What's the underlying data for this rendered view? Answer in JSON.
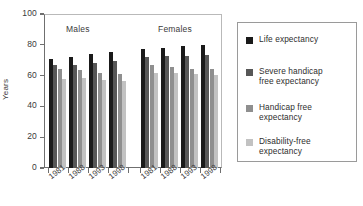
{
  "chart_data": {
    "type": "bar",
    "title": "",
    "subtitle": "",
    "xlabel": "",
    "ylabel": "Years",
    "ylim": [
      0,
      100
    ],
    "yticks": [
      0,
      20,
      40,
      60,
      80,
      100
    ],
    "ytick_labels": [
      "0",
      "20",
      "40",
      "60",
      "80",
      "100"
    ],
    "grid": false,
    "legend_position": "right",
    "group_labels": [
      "Males",
      "Females"
    ],
    "categories": [
      "1981",
      "1988",
      "1993",
      "1998"
    ],
    "series": [
      {
        "name": "Life expectancy",
        "color": "#1a1a1a",
        "values_males": [
          71.1,
          72.4,
          74.0,
          75.1
        ],
        "values_females": [
          77.1,
          78.0,
          79.3,
          80.0
        ]
      },
      {
        "name": "Severe handicap free expectancy",
        "color": "#575757",
        "values_males": [
          66.9,
          67.1,
          68.2,
          69.3
        ],
        "values_females": [
          72.2,
          72.6,
          73.0,
          73.1
        ]
      },
      {
        "name": "Handicap free expectancy",
        "color": "#8f8f8f",
        "values_males": [
          64.4,
          63.5,
          61.8,
          61.2
        ],
        "values_females": [
          66.9,
          65.6,
          64.5,
          64.4
        ]
      },
      {
        "name": "Disability-free expectancy",
        "color": "#c2c2c2",
        "values_males": [
          58.1,
          58.6,
          57.3,
          56.8
        ],
        "values_females": [
          61.8,
          61.6,
          61.0,
          60.7
        ]
      }
    ]
  },
  "legend": {
    "items": [
      {
        "label": "Life expectancy",
        "color": "#1a1a1a"
      },
      {
        "label": "Severe handicap\nfree expectancy",
        "color": "#575757"
      },
      {
        "label": "Handicap free\nexpectancy",
        "color": "#8f8f8f"
      },
      {
        "label": "Disability-free\nexpectancy",
        "color": "#c2c2c2"
      }
    ]
  }
}
